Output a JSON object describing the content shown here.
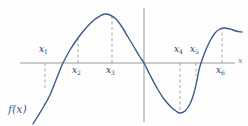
{
  "figure": {
    "kind": "function-graph",
    "function_label": "f(x)",
    "x_axis_label": "x",
    "colors": {
      "curve": "#3d5a8a",
      "axis": "#9a9a9a",
      "dash": "#a8a8a8",
      "label": "#1f3557",
      "function_label": "#3b5d96",
      "background": "#fefefe"
    }
  },
  "axes": {
    "x_axis": {
      "y": 63,
      "x_start": 20,
      "x_end": 235
    },
    "y_axis": {
      "x": 144,
      "y_start": 8,
      "y_end": 122
    }
  },
  "chart_data": {
    "type": "line",
    "title": "",
    "xlabel": "x",
    "ylabel": "",
    "grid": false,
    "legend": "none",
    "series": [
      {
        "name": "f(x)",
        "points": [
          [
            33,
            124
          ],
          [
            38,
            116
          ],
          [
            44,
            106
          ],
          [
            50,
            95
          ],
          [
            56,
            80
          ],
          [
            60,
            70
          ],
          [
            63,
            63
          ],
          [
            70,
            50
          ],
          [
            78,
            38
          ],
          [
            86,
            28
          ],
          [
            94,
            20
          ],
          [
            100,
            16
          ],
          [
            105,
            14
          ],
          [
            110,
            15
          ],
          [
            116,
            19
          ],
          [
            122,
            27
          ],
          [
            128,
            37
          ],
          [
            134,
            47
          ],
          [
            140,
            57
          ],
          [
            144,
            63
          ],
          [
            150,
            75
          ],
          [
            157,
            88
          ],
          [
            164,
            99
          ],
          [
            171,
            107
          ],
          [
            176,
            111
          ],
          [
            180,
            113
          ],
          [
            185,
            111
          ],
          [
            190,
            104
          ],
          [
            194,
            93
          ],
          [
            197,
            80
          ],
          [
            199,
            70
          ],
          [
            201,
            63
          ],
          [
            205,
            52
          ],
          [
            210,
            41
          ],
          [
            215,
            33
          ],
          [
            220,
            29
          ],
          [
            224,
            28
          ],
          [
            230,
            29
          ],
          [
            236,
            31
          ],
          [
            242,
            32
          ]
        ]
      }
    ],
    "markers": [
      {
        "name": "x1",
        "label": "x",
        "sub": "1",
        "x": 45,
        "dash_from_y": 63,
        "dash_to_y": 90,
        "label_side": "above",
        "label_x": 39,
        "label_y": 45
      },
      {
        "name": "x2",
        "label": "x",
        "sub": "2",
        "x": 78,
        "dash_from_y": 63,
        "dash_to_y": 36,
        "label_side": "below",
        "label_x": 72,
        "label_y": 66
      },
      {
        "name": "x3",
        "label": "x",
        "sub": "3",
        "x": 112,
        "dash_from_y": 63,
        "dash_to_y": 15,
        "label_side": "below",
        "label_x": 106,
        "label_y": 66
      },
      {
        "name": "x4",
        "label": "x",
        "sub": "4",
        "x": 180,
        "dash_from_y": 63,
        "dash_to_y": 113,
        "label_side": "above",
        "label_x": 174,
        "label_y": 45
      },
      {
        "name": "x5",
        "label": "x",
        "sub": "5",
        "x": 196,
        "dash_from_y": 63,
        "dash_to_y": 76,
        "label_side": "above",
        "label_x": 190,
        "label_y": 45
      },
      {
        "name": "x6",
        "label": "x",
        "sub": "6",
        "x": 222,
        "dash_from_y": 63,
        "dash_to_y": 29,
        "label_side": "below",
        "label_x": 216,
        "label_y": 66
      }
    ],
    "annotations": [
      {
        "name": "function-label",
        "text": "f(x)",
        "x": 8,
        "y": 104
      },
      {
        "name": "x-axis-label",
        "text": "x",
        "x": 237,
        "y": 57
      }
    ]
  }
}
